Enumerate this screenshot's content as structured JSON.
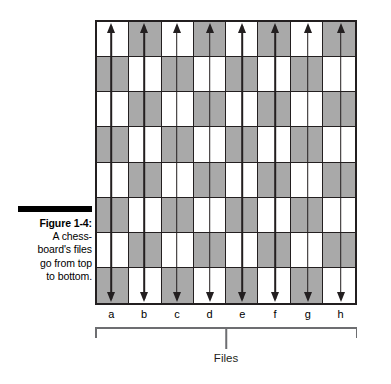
{
  "figure": {
    "label": "Figure 1-4:",
    "caption_lines": [
      "A chess-",
      "board's files",
      "go from top",
      "to bottom."
    ],
    "caption_full": "Figure 1-4: A chessboard's files go from top to bottom."
  },
  "board": {
    "rows": 8,
    "columns": 8,
    "top_left_square": "light",
    "light_color": "#ffffff",
    "dark_color": "#a9a9a9",
    "border_color": "#231f20"
  },
  "files": {
    "labels": [
      "a",
      "b",
      "c",
      "d",
      "e",
      "f",
      "g",
      "h"
    ],
    "bracket_label": "Files",
    "bracket_color": "#6d6e71"
  },
  "arrows": {
    "count": 8,
    "direction": "double-vertical",
    "color": "#231f20"
  },
  "chart_data": {
    "type": "diagram",
    "categories": [
      "a",
      "b",
      "c",
      "d",
      "e",
      "f",
      "g",
      "h"
    ],
    "grid": {
      "rows": 8,
      "columns": 8,
      "top_left_square": "light"
    },
    "annotations": [
      "Files"
    ]
  }
}
